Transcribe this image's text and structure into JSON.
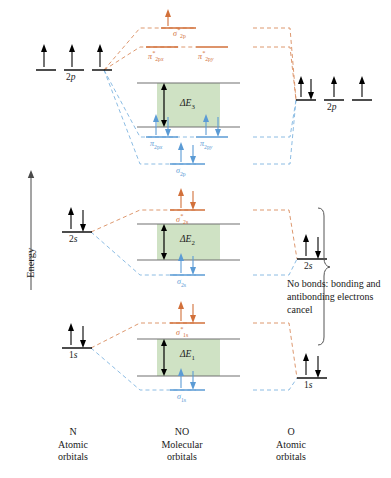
{
  "figure": {
    "type": "molecular-orbital-energy-diagram",
    "molecule": "NO",
    "energy_axis_label": "Energy",
    "note_text": "No bonds: bonding and antibonding electrons cancel",
    "colors": {
      "antibonding": "#d2703a",
      "bonding": "#5b9bd5",
      "gap_fill": "#cfe2c4",
      "gap_stroke": "#6f6f6f",
      "level": "#000000",
      "text": "#1a1a1a"
    }
  },
  "footer": {
    "left": {
      "species": "N",
      "line1": "Atomic",
      "line2": "orbitals"
    },
    "center": {
      "species": "NO",
      "line1": "Molecular",
      "line2": "orbitals"
    },
    "right": {
      "species": "O",
      "line1": "Atomic",
      "line2": "orbitals"
    }
  },
  "atomic_left": {
    "species": "N",
    "levels": [
      {
        "label": "2p",
        "n": "2",
        "orbital": "p",
        "sublevels": 3,
        "electrons": [
          1,
          1,
          1
        ],
        "spins": [
          "up",
          "up",
          "up"
        ]
      },
      {
        "label": "2s",
        "n": "2",
        "orbital": "s",
        "sublevels": 1,
        "electrons": [
          2
        ],
        "spins": [
          "up-down"
        ]
      },
      {
        "label": "1s",
        "n": "1",
        "orbital": "s",
        "sublevels": 1,
        "electrons": [
          2
        ],
        "spins": [
          "up-down"
        ]
      }
    ]
  },
  "atomic_right": {
    "species": "O",
    "levels": [
      {
        "label": "2p",
        "n": "2",
        "orbital": "p",
        "sublevels": 3,
        "electrons": [
          2,
          1,
          1
        ],
        "spins": [
          "up-down",
          "up",
          "up"
        ]
      },
      {
        "label": "2s",
        "n": "2",
        "orbital": "s",
        "sublevels": 1,
        "electrons": [
          2
        ],
        "spins": [
          "up-down"
        ]
      },
      {
        "label": "1s",
        "n": "1",
        "orbital": "s",
        "sublevels": 1,
        "electrons": [
          2
        ],
        "spins": [
          "up-down"
        ]
      }
    ]
  },
  "molecular_orbitals": [
    {
      "id": "sigma-star-2p",
      "sym": "σ",
      "sub": "2p",
      "star": true,
      "type": "antibonding",
      "electrons": 1,
      "spins": [
        "up"
      ]
    },
    {
      "id": "pi-star-2px",
      "sym": "π",
      "sub": "2px",
      "star": true,
      "type": "antibonding",
      "electrons": 0,
      "spins": []
    },
    {
      "id": "pi-star-2py",
      "sym": "π",
      "sub": "2py",
      "star": true,
      "type": "antibonding",
      "electrons": 0,
      "spins": []
    },
    {
      "id": "pi-2px",
      "sym": "π",
      "sub": "2px",
      "star": false,
      "type": "bonding",
      "electrons": 2,
      "spins": [
        "up-down"
      ]
    },
    {
      "id": "pi-2py",
      "sym": "π",
      "sub": "2py",
      "star": false,
      "type": "bonding",
      "electrons": 2,
      "spins": [
        "up-down"
      ]
    },
    {
      "id": "sigma-2p",
      "sym": "σ",
      "sub": "2p",
      "star": false,
      "type": "bonding",
      "electrons": 2,
      "spins": [
        "up-down"
      ]
    },
    {
      "id": "sigma-star-2s",
      "sym": "σ",
      "sub": "2s",
      "star": true,
      "type": "antibonding",
      "electrons": 2,
      "spins": [
        "up-down"
      ]
    },
    {
      "id": "sigma-2s",
      "sym": "σ",
      "sub": "2s",
      "star": false,
      "type": "bonding",
      "electrons": 2,
      "spins": [
        "up-down"
      ]
    },
    {
      "id": "sigma-star-1s",
      "sym": "σ",
      "sub": "1s",
      "star": true,
      "type": "antibonding",
      "electrons": 2,
      "spins": [
        "up-down"
      ]
    },
    {
      "id": "sigma-1s",
      "sym": "σ",
      "sub": "1s",
      "star": false,
      "type": "bonding",
      "electrons": 2,
      "spins": [
        "up-down"
      ]
    }
  ],
  "energy_gaps": [
    {
      "id": "delta-e-3",
      "label": "ΔE",
      "index": "3",
      "associated_shell": "2p"
    },
    {
      "id": "delta-e-2",
      "label": "ΔE",
      "index": "2",
      "associated_shell": "2s"
    },
    {
      "id": "delta-e-1",
      "label": "ΔE",
      "index": "1",
      "associated_shell": "1s"
    }
  ],
  "labels": {
    "sigma_star_2p": "σ*2p",
    "pi_star_2px": "π*2px",
    "pi_star_2py": "π*2py",
    "pi_2px": "π2px",
    "pi_2py": "π2py",
    "sigma_2p": "σ2p",
    "sigma_star_2s": "σ*2s",
    "sigma_2s": "σ2s",
    "sigma_star_1s": "σ*1s",
    "sigma_1s": "σ1s"
  }
}
